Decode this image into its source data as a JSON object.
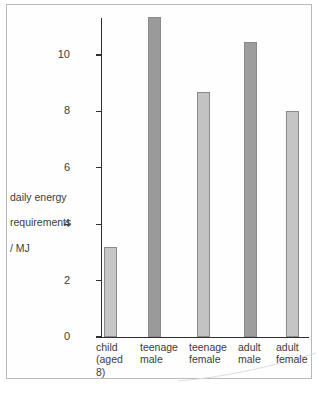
{
  "chart_data": {
    "type": "bar",
    "title": "",
    "xlabel": "",
    "ylabel": "daily energy requirements / MJ",
    "ylim": [
      0,
      11.8
    ],
    "yticks": [
      0,
      2,
      4,
      6,
      8,
      10
    ],
    "ytick_labels": [
      "0",
      "2",
      "4",
      "6",
      "8",
      "10"
    ],
    "grid": false,
    "legend": false,
    "categories": [
      "child\n(aged\n8)",
      "teenage\nmale",
      "teenage\nfemale",
      "adult\nmale",
      "adult\nfemale"
    ],
    "values": [
      3.2,
      11.35,
      8.7,
      10.45,
      8.0
    ],
    "bar_colors": [
      "#c7c7c7",
      "#9a9a9a",
      "#c3c3c3",
      "#9d9d9d",
      "#c5c5c5"
    ],
    "bar_edge_color": "#8a8a8a",
    "axis_color": "#2f2f2f"
  },
  "axis": {
    "y_title_line1": "daily energy",
    "y_title_line2": "requirements",
    "y_title_line3": "/ MJ"
  }
}
